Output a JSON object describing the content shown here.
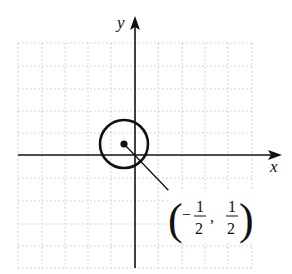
{
  "figure": {
    "type": "coordinate-plane-circle",
    "axes": {
      "x_label": "x",
      "y_label": "y"
    },
    "grid": {
      "style": "dotted",
      "spacing_units": 0.5,
      "x_range": [
        -2.5,
        2.5
      ],
      "y_range": [
        -2.5,
        2.5
      ]
    },
    "circle": {
      "center": {
        "x": -0.5,
        "y": 0.5
      },
      "radius": 1
    },
    "center_point": {
      "label_open": "(",
      "label_sign": "−",
      "x_num": "1",
      "x_den": "2",
      "separator": ",",
      "y_num": "1",
      "y_den": "2",
      "label_close": ")"
    },
    "colors": {
      "ink": "#111111",
      "grid": "#b8b8b8",
      "background": "#ffffff"
    }
  }
}
